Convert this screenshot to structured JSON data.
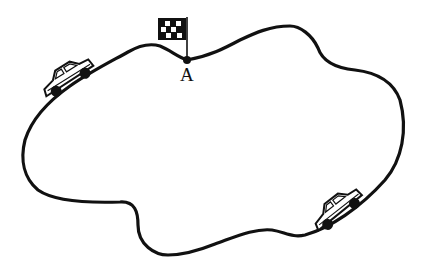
{
  "diagram": {
    "type": "race-track",
    "point_label": "A",
    "colors": {
      "line": "#111111",
      "background": "#ffffff"
    },
    "elements": [
      {
        "kind": "track",
        "shape": "closed-loop"
      },
      {
        "kind": "checkered-flag",
        "position": "above point A"
      },
      {
        "kind": "point",
        "label": "A"
      },
      {
        "kind": "car",
        "position": "upper-left of track"
      },
      {
        "kind": "car",
        "position": "lower-right of track"
      }
    ]
  }
}
